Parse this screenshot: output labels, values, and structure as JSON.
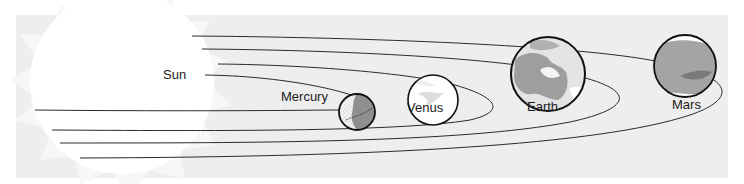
{
  "diagram": {
    "colors": {
      "background": "#ffffff",
      "panel": "#efefef",
      "sun": "#ffffff",
      "orbit": "#2a2a2a",
      "outline": "#111111"
    },
    "sun": {
      "label": "Sun"
    },
    "planets": [
      {
        "name": "mercury",
        "label": "Mercury"
      },
      {
        "name": "venus",
        "label": "Venus"
      },
      {
        "name": "earth",
        "label": "Earth"
      },
      {
        "name": "mars",
        "label": "Mars"
      }
    ]
  }
}
